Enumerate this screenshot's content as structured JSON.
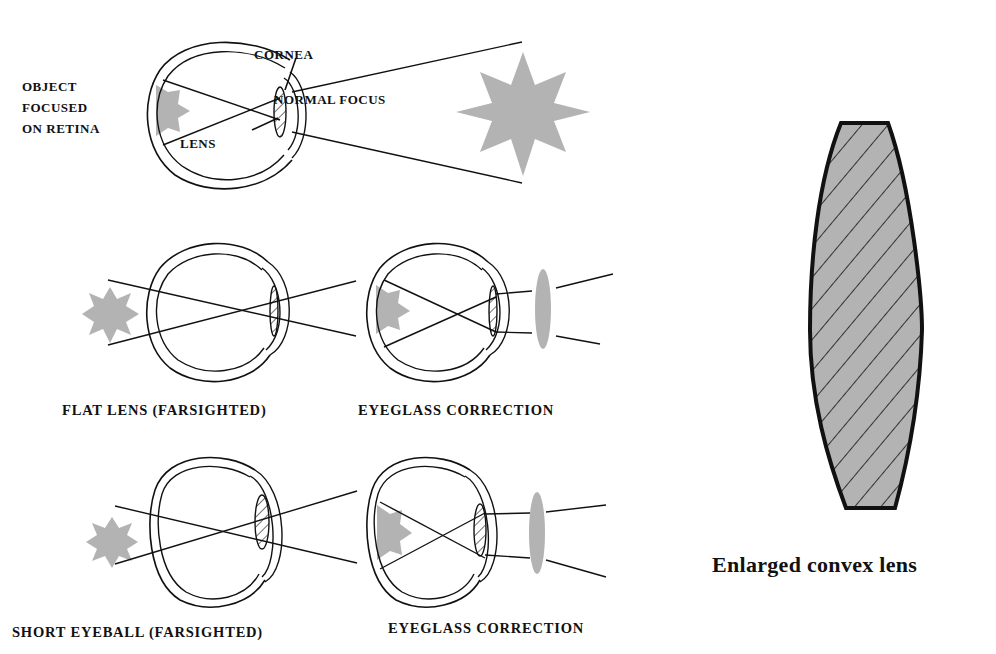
{
  "panels": {
    "normal": {
      "object_label_lines": [
        "OBJECT",
        "FOCUSED",
        "ON RETINA"
      ],
      "cornea_label": "CORNEA",
      "lens_label": "LENS",
      "focus_label": "NORMAL FOCUS"
    },
    "flat_lens": {
      "caption": "FLAT LENS (FARSIGHTED)",
      "correction_caption": "EYEGLASS CORRECTION"
    },
    "short_eyeball": {
      "caption": "SHORT EYEBALL (FARSIGHTED)",
      "correction_caption": "EYEGLASS CORRECTION"
    },
    "convex_lens": {
      "caption": "Enlarged convex lens"
    }
  },
  "colors": {
    "ink": "#111111",
    "gray_fill": "#b3b3b3",
    "background": "#ffffff"
  }
}
